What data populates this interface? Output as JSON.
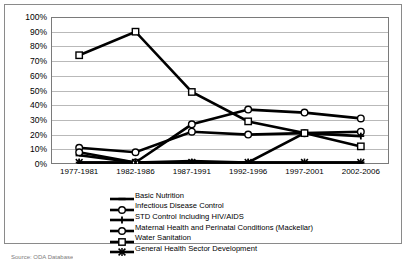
{
  "chart_data": {
    "type": "line",
    "title": "",
    "xlabel": "",
    "ylabel": "",
    "ylim": [
      0,
      100
    ],
    "ytick_labels": [
      "100%",
      "90%",
      "80%",
      "70%",
      "60%",
      "50%",
      "40%",
      "30%",
      "20%",
      "10%",
      "0%"
    ],
    "ytick_values": [
      100,
      90,
      80,
      70,
      60,
      50,
      40,
      30,
      20,
      10,
      0
    ],
    "grid": true,
    "legend_position": "bottom",
    "categories": [
      "1977-1981",
      "1982-1986",
      "1987-1991",
      "1992-1996",
      "1997-2001",
      "2002-2006"
    ],
    "series": [
      {
        "name": "Basic Nutrition",
        "marker": "dash",
        "values": [
          6,
          1,
          2,
          1,
          1,
          1
        ]
      },
      {
        "name": "Infectious Disease Control",
        "marker": "circle",
        "values": [
          11,
          8,
          22,
          20,
          21,
          22
        ]
      },
      {
        "name": "STD Control Including HIV/AIDS",
        "marker": "plus",
        "values": [
          1,
          1,
          1,
          1,
          21,
          19
        ]
      },
      {
        "name": "Maternal Health and Perinatal Conditions (Mackellar)",
        "marker": "circle-open",
        "values": [
          8,
          1,
          27,
          37,
          35,
          31
        ]
      },
      {
        "name": "Water Sanitation",
        "marker": "square",
        "values": [
          74,
          90,
          49,
          29,
          21,
          12
        ]
      },
      {
        "name": "General Health Sector Development",
        "marker": "star",
        "values": [
          1,
          1,
          1,
          1,
          1,
          1
        ]
      }
    ]
  },
  "legend": {
    "items": [
      {
        "label": "Basic Nutrition",
        "marker": "dash"
      },
      {
        "label": "Infectious Disease Control",
        "marker": "circle"
      },
      {
        "label": "STD Control Including HIV/AIDS",
        "marker": "plus"
      },
      {
        "label": "Maternal Health and Perinatal Conditions (Mackellar)",
        "marker": "circle-open"
      },
      {
        "label": "Water Sanitation",
        "marker": "square"
      },
      {
        "label": "General Health Sector Development",
        "marker": "star"
      }
    ]
  },
  "footer": {
    "source_text": "Source: ODA Database"
  },
  "colors": {
    "line": "#000000",
    "grid": "#b9b9b9",
    "frame": "#8a8a8a"
  }
}
